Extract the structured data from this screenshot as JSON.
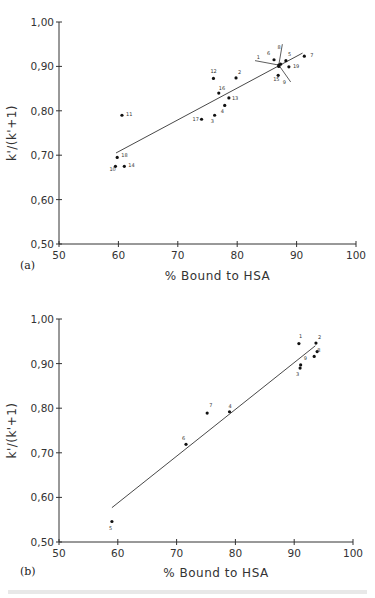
{
  "chart_data": [
    {
      "type": "scatter",
      "panel_label": "(a)",
      "title": "",
      "xlabel": "% Bound to HSA",
      "ylabel": "k'/(k'+1)",
      "xlim": [
        50,
        100
      ],
      "ylim": [
        0.5,
        1.0
      ],
      "xticks": [
        "50",
        "60",
        "70",
        "80",
        "90",
        "100"
      ],
      "yticks": [
        "0,50",
        "0,60",
        "0,70",
        "0,80",
        "0,90",
        "1,00"
      ],
      "grid": false,
      "points": [
        {
          "label": "1",
          "x": 87.0,
          "y": 0.903
        },
        {
          "label": "2",
          "x": 79.8,
          "y": 0.874
        },
        {
          "label": "3",
          "x": 76.2,
          "y": 0.79
        },
        {
          "label": "4",
          "x": 77.9,
          "y": 0.812
        },
        {
          "label": "5",
          "x": 88.2,
          "y": 0.913
        },
        {
          "label": "6",
          "x": 86.2,
          "y": 0.915
        },
        {
          "label": "7",
          "x": 91.3,
          "y": 0.923
        },
        {
          "label": "8",
          "x": 87.3,
          "y": 0.905
        },
        {
          "label": "9",
          "x": 87.0,
          "y": 0.9
        },
        {
          "label": "10",
          "x": 59.5,
          "y": 0.675
        },
        {
          "label": "11",
          "x": 60.6,
          "y": 0.79
        },
        {
          "label": "12",
          "x": 76.0,
          "y": 0.873
        },
        {
          "label": "13",
          "x": 78.6,
          "y": 0.829
        },
        {
          "label": "14",
          "x": 61.0,
          "y": 0.675
        },
        {
          "label": "15",
          "x": 86.9,
          "y": 0.88
        },
        {
          "label": "16",
          "x": 76.9,
          "y": 0.84
        },
        {
          "label": "17",
          "x": 74.0,
          "y": 0.781
        },
        {
          "label": "18",
          "x": 59.8,
          "y": 0.695
        },
        {
          "label": "19",
          "x": 88.7,
          "y": 0.899
        }
      ],
      "regression_line": {
        "x1": 59.6,
        "y1": 0.705,
        "x2": 91.0,
        "y2": 0.93
      }
    },
    {
      "type": "scatter",
      "panel_label": "(b)",
      "title": "",
      "xlabel": "% Bound to HSA",
      "ylabel": "k'/(k'+1)",
      "xlim": [
        50,
        100
      ],
      "ylim": [
        0.5,
        1.0
      ],
      "xticks": [
        "50",
        "60",
        "70",
        "80",
        "90",
        "100"
      ],
      "yticks": [
        "0,50",
        "0,60",
        "0,70",
        "0,80",
        "0,90",
        "1,00"
      ],
      "grid": false,
      "points": [
        {
          "label": "1",
          "x": 90.8,
          "y": 0.945
        },
        {
          "label": "2",
          "x": 93.7,
          "y": 0.946
        },
        {
          "label": "3",
          "x": 91.0,
          "y": 0.89
        },
        {
          "label": "4",
          "x": 79.0,
          "y": 0.792
        },
        {
          "label": "5",
          "x": 59.0,
          "y": 0.546
        },
        {
          "label": "6",
          "x": 71.6,
          "y": 0.719
        },
        {
          "label": "7",
          "x": 75.2,
          "y": 0.789
        },
        {
          "label": "8",
          "x": 93.9,
          "y": 0.927
        },
        {
          "label": "9",
          "x": 91.1,
          "y": 0.897
        },
        {
          "label": "",
          "x": 93.4,
          "y": 0.916
        }
      ],
      "regression_line": {
        "x1": 59.0,
        "y1": 0.577,
        "x2": 93.6,
        "y2": 0.94
      }
    }
  ]
}
